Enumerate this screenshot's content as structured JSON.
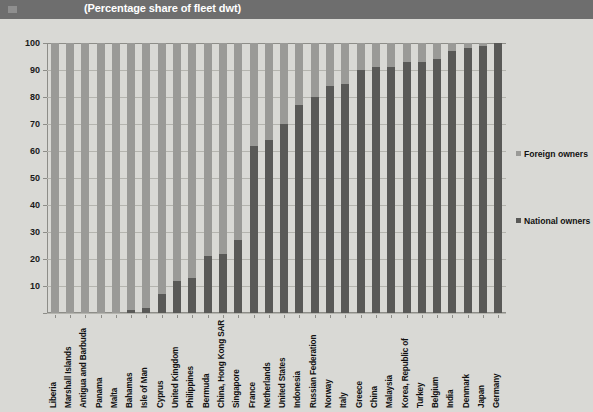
{
  "banner": {
    "title": "(Percentage share of fleet dwt)",
    "swatch_icon": "square-icon",
    "bg_color": "#6e6e6e"
  },
  "legend": {
    "position": "right",
    "items": [
      {
        "label": "Foreign owners",
        "color": "#9a9a97"
      },
      {
        "label": "National owners",
        "color": "#595957"
      }
    ]
  },
  "chart_data": {
    "type": "bar",
    "stacked": true,
    "title": "(Percentage share of fleet dwt)",
    "xlabel": "",
    "ylabel": "",
    "ylim": [
      0,
      100
    ],
    "yticks": [
      0,
      10,
      20,
      30,
      40,
      50,
      60,
      70,
      80,
      90,
      100
    ],
    "ytick_labels": [
      "",
      "10",
      "20",
      "30",
      "40",
      "50",
      "60",
      "70",
      "80",
      "90",
      "100"
    ],
    "grid": true,
    "legend_position": "right",
    "categories": [
      "Liberia",
      "Marshall Islands",
      "Antigua and Barbuda",
      "Panama",
      "Malta",
      "Bahamas",
      "Isle of Man",
      "Cyprus",
      "United Kingdom",
      "Philippines",
      "Bermuda",
      "China, Hong Kong SAR",
      "Singapore",
      "France",
      "Netherlands",
      "United States",
      "Indonesia",
      "Russian Federation",
      "Norway",
      "Italy",
      "Greece",
      "China",
      "Malaysia",
      "Korea, Republic of",
      "Turkey",
      "Belgium",
      "India",
      "Denmark",
      "Japan",
      "Germany"
    ],
    "series": [
      {
        "name": "National owners",
        "color": "#595957",
        "values": [
          0,
          0,
          0,
          0,
          0,
          1,
          2,
          7,
          12,
          13,
          21,
          22,
          27,
          62,
          64,
          70,
          77,
          80,
          84,
          85,
          90,
          91,
          91,
          93,
          93,
          94,
          97,
          98,
          99,
          100
        ]
      },
      {
        "name": "Foreign owners",
        "color": "#9a9a97",
        "values": [
          100,
          100,
          100,
          100,
          100,
          99,
          98,
          93,
          88,
          87,
          79,
          78,
          73,
          38,
          36,
          30,
          23,
          20,
          16,
          15,
          10,
          9,
          9,
          7,
          7,
          6,
          3,
          2,
          1,
          0
        ]
      }
    ]
  }
}
